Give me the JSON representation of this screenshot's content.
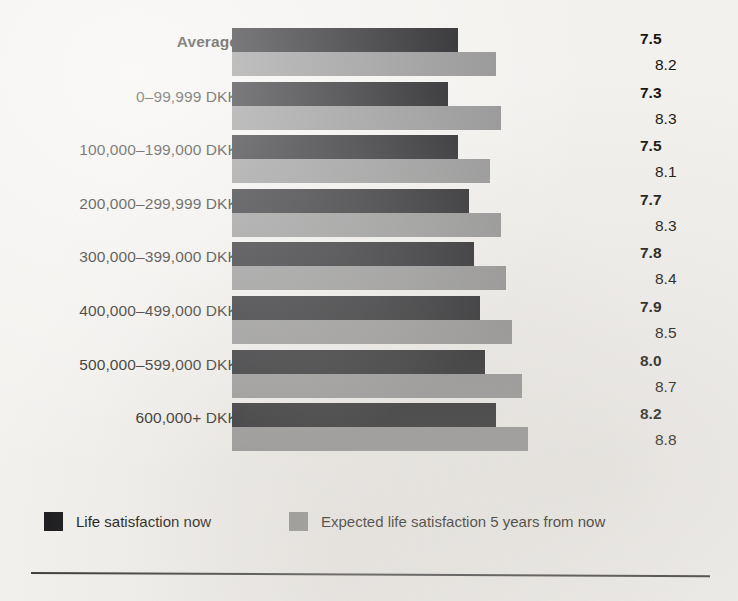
{
  "figure": {
    "background_color": "#f3f1ee",
    "text_color": "#16150f"
  },
  "legend": {
    "items": [
      {
        "key": "now",
        "label": "Life satisfaction now",
        "color": "#16161a"
      },
      {
        "key": "future",
        "label": "Expected life satisfaction 5 years from now",
        "color": "#8d8d8d"
      }
    ]
  },
  "chart_data": {
    "type": "bar",
    "orientation": "horizontal",
    "title": "",
    "xlabel": "",
    "ylabel": "",
    "xlim": [
      0,
      10
    ],
    "grid": false,
    "legend_position": "bottom-left",
    "value_labels": true,
    "categories": [
      "Average",
      "0–99,999 DKK",
      "100,000–199,000 DKK",
      "200,000–299,999 DKK",
      "300,000–399,000 DKK",
      "400,000–499,000 DKK",
      "500,000–599,000 DKK",
      "600,000+ DKK"
    ],
    "series": [
      {
        "name": "Life satisfaction now",
        "color": "#16161a",
        "values": [
          7.5,
          7.3,
          7.5,
          7.7,
          7.8,
          7.9,
          8.0,
          8.2
        ]
      },
      {
        "name": "Expected life satisfaction 5 years from now",
        "color": "#8d8d8d",
        "values": [
          8.2,
          8.3,
          8.1,
          8.3,
          8.4,
          8.5,
          8.7,
          8.8
        ]
      }
    ]
  }
}
